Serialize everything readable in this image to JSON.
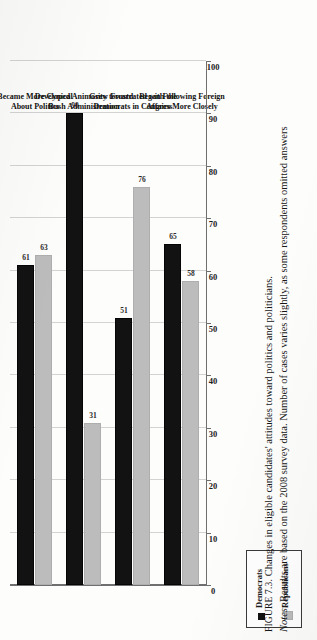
{
  "figure": {
    "tag": "FIGURE 7.3.",
    "title": "Changes in eligible candidates' attitudes toward politics and politicians.",
    "notes_tag": "Notes:",
    "notes": "Results are based on the 2008 survey data. Number of cases varies slightly, as some respondents omitted answers"
  },
  "legend": {
    "items": [
      {
        "label": "Democrats",
        "color": "#121212"
      },
      {
        "label": "Republicans",
        "color": "#bcbcbc"
      }
    ]
  },
  "axis": {
    "ticks": [
      "0",
      "10",
      "20",
      "30",
      "40",
      "50",
      "60",
      "70",
      "80",
      "90",
      "100"
    ]
  },
  "chart_data": {
    "type": "bar",
    "orientation": "horizontal",
    "title": "Changes in eligible candidates' attitudes toward politics and politicians.",
    "xlabel": "",
    "ylabel": "",
    "xlim": [
      0,
      100
    ],
    "grid": true,
    "legend_position": "left",
    "categories": [
      "Became More Cynical About Politics",
      "Developed Animosity toward Bush Administration",
      "Grew Frustrated with the Democrats in Congress",
      "Began Following Foreign Affairs More Closely"
    ],
    "category_lines": [
      [
        "Became More Cynical",
        "About Politics"
      ],
      [
        "Developed Animosity toward",
        "Bush Administration"
      ],
      [
        "Grew Frustrated with the",
        "Democrats in Congress"
      ],
      [
        "Began Following Foreign",
        "Affairs More Closely"
      ]
    ],
    "series": [
      {
        "name": "Democrats",
        "color": "#121212",
        "values": [
          61,
          90,
          51,
          65
        ]
      },
      {
        "name": "Republicans",
        "color": "#bcbcbc",
        "values": [
          63,
          31,
          76,
          58
        ]
      }
    ]
  }
}
